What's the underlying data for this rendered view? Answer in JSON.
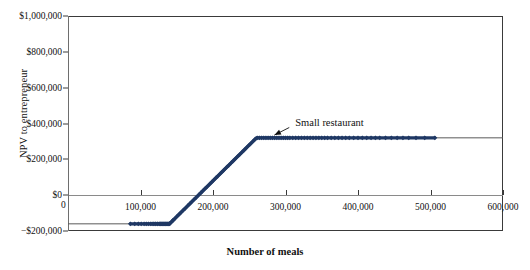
{
  "chart_data": {
    "type": "scatter",
    "title": "",
    "xlabel": "Number of meals",
    "ylabel": "NPV to entrepreneur",
    "xlim": [
      0,
      600000
    ],
    "ylim": [
      -200000,
      1000000
    ],
    "grid": false,
    "legend": "none",
    "x_ticks": [
      0,
      100000,
      200000,
      300000,
      400000,
      500000,
      600000
    ],
    "x_tick_labels": [
      "0",
      "100,000",
      "200,000",
      "300,000",
      "400,000",
      "500,000",
      "600,000"
    ],
    "y_ticks": [
      -200000,
      0,
      200000,
      400000,
      600000,
      800000,
      1000000
    ],
    "y_tick_labels": [
      "−$200,000",
      "$0",
      "$200,000",
      "$400,000",
      "$600,000",
      "$800,000",
      "$1,000,000"
    ],
    "series": [
      {
        "name": "NPV to entrepreneur",
        "color": "#1F3864",
        "marker": "diamond",
        "line_color": "#5a5a5a",
        "description": "Piecewise payoff: floor at -160,000 until 140,000 meals, linear rise to 320,000 at 260,000 meals, then flat cap at 320,000",
        "breakpoints": [
          {
            "x": 0,
            "y": -160000
          },
          {
            "x": 140000,
            "y": -160000
          },
          {
            "x": 260000,
            "y": 320000
          },
          {
            "x": 600000,
            "y": 320000
          }
        ],
        "floor_value": -160000,
        "cap_value": 320000,
        "ramp_start_x": 140000,
        "ramp_end_x": 260000,
        "points_x": [
          86000,
          92000,
          97000,
          101000,
          105000,
          108000,
          111000,
          114000,
          116000,
          118000,
          120000,
          121000,
          123000,
          124000,
          126000,
          127000,
          128000,
          129000,
          130000,
          131000,
          132000,
          133000,
          134000,
          135000,
          136000,
          137000,
          138000,
          139000,
          140000,
          141000,
          143000,
          145000,
          147000,
          150000,
          153000,
          156000,
          159000,
          162000,
          165000,
          168000,
          171000,
          174000,
          177000,
          180000,
          183000,
          186000,
          189000,
          192000,
          195000,
          198000,
          201000,
          204000,
          207000,
          210000,
          213000,
          216000,
          219000,
          222000,
          225000,
          228000,
          231000,
          234000,
          237000,
          240000,
          243000,
          246000,
          249000,
          252000,
          255000,
          258000,
          261000,
          264000,
          267000,
          270000,
          273000,
          276000,
          279000,
          282000,
          285000,
          288000,
          291000,
          294000,
          297000,
          300000,
          303000,
          306000,
          310000,
          314000,
          318000,
          322000,
          326000,
          330000,
          334000,
          338000,
          342000,
          346000,
          350000,
          354000,
          358000,
          363000,
          368000,
          373000,
          378000,
          383000,
          388000,
          394000,
          400000,
          406000,
          412000,
          418000,
          424000,
          430000,
          438000,
          446000,
          454000,
          462000,
          470000,
          480000,
          492000,
          506000
        ]
      }
    ],
    "annotations": [
      {
        "text": "Small restaurant",
        "x": 330000,
        "y": 400000,
        "arrow_to_x": 282000,
        "arrow_to_y": 330000
      }
    ]
  },
  "axes": {
    "y_title": "NPV to entrepreneur",
    "x_title": "Number of meals",
    "origin_label": "0"
  }
}
